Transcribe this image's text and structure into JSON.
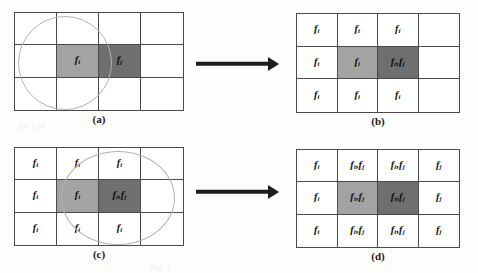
{
  "figure": {
    "colors": {
      "light_cell": "#a3a3a3",
      "dark_cell": "#6f6f6f",
      "plain_cell": "#ffffff",
      "grid_line": "#4a4a4a",
      "circle_stroke": "#b9b2ab",
      "arrow": "#1d1d1d",
      "background": "#fdfdfc"
    },
    "grid_shape": {
      "cols": 4,
      "rows": 3
    },
    "labels": {
      "fi": "f",
      "fi_sub": "i",
      "fj": "f",
      "fj_sub": "j"
    },
    "panels": [
      {
        "id": "a",
        "caption": "(a)",
        "neighborhood_circle": true,
        "circle_center_cell": {
          "row": 1,
          "col": 1
        },
        "cells": [
          [
            {
              "fill": "plain",
              "label": ""
            },
            {
              "fill": "plain",
              "label": ""
            },
            {
              "fill": "plain",
              "label": ""
            },
            {
              "fill": "plain",
              "label": ""
            }
          ],
          [
            {
              "fill": "plain",
              "label": ""
            },
            {
              "fill": "light",
              "label": "fi"
            },
            {
              "fill": "dark",
              "label": "fj"
            },
            {
              "fill": "plain",
              "label": ""
            }
          ],
          [
            {
              "fill": "plain",
              "label": ""
            },
            {
              "fill": "plain",
              "label": ""
            },
            {
              "fill": "plain",
              "label": ""
            },
            {
              "fill": "plain",
              "label": ""
            }
          ]
        ]
      },
      {
        "id": "b",
        "caption": "(b)",
        "neighborhood_circle": false,
        "circle_center_cell": null,
        "cells": [
          [
            {
              "fill": "plain",
              "label": "fi"
            },
            {
              "fill": "plain",
              "label": "fi"
            },
            {
              "fill": "plain",
              "label": "fi"
            },
            {
              "fill": "plain",
              "label": ""
            }
          ],
          [
            {
              "fill": "plain",
              "label": "fi"
            },
            {
              "fill": "light",
              "label": "fi"
            },
            {
              "fill": "dark",
              "label": "fi,fj"
            },
            {
              "fill": "plain",
              "label": ""
            }
          ],
          [
            {
              "fill": "plain",
              "label": "fi"
            },
            {
              "fill": "plain",
              "label": "fi"
            },
            {
              "fill": "plain",
              "label": "fi"
            },
            {
              "fill": "plain",
              "label": ""
            }
          ]
        ]
      },
      {
        "id": "c",
        "caption": "(c)",
        "neighborhood_circle": true,
        "circle_center_cell": {
          "row": 1,
          "col": 2
        },
        "cells": [
          [
            {
              "fill": "plain",
              "label": "fi"
            },
            {
              "fill": "plain",
              "label": "fi"
            },
            {
              "fill": "plain",
              "label": "fi"
            },
            {
              "fill": "plain",
              "label": ""
            }
          ],
          [
            {
              "fill": "plain",
              "label": "fi"
            },
            {
              "fill": "light",
              "label": "fi"
            },
            {
              "fill": "dark",
              "label": "fi,fj"
            },
            {
              "fill": "plain",
              "label": ""
            }
          ],
          [
            {
              "fill": "plain",
              "label": "fi"
            },
            {
              "fill": "plain",
              "label": "fi"
            },
            {
              "fill": "plain",
              "label": "fi"
            },
            {
              "fill": "plain",
              "label": ""
            }
          ]
        ]
      },
      {
        "id": "d",
        "caption": "(d)",
        "neighborhood_circle": false,
        "circle_center_cell": null,
        "cells": [
          [
            {
              "fill": "plain",
              "label": "fi"
            },
            {
              "fill": "plain",
              "label": "fi,fj"
            },
            {
              "fill": "plain",
              "label": "fi,fj"
            },
            {
              "fill": "plain",
              "label": "fj"
            }
          ],
          [
            {
              "fill": "plain",
              "label": "fi"
            },
            {
              "fill": "light",
              "label": "fi,fj"
            },
            {
              "fill": "dark",
              "label": "fi,fj"
            },
            {
              "fill": "plain",
              "label": "fj"
            }
          ],
          [
            {
              "fill": "plain",
              "label": "fi"
            },
            {
              "fill": "plain",
              "label": "fi,fj"
            },
            {
              "fill": "plain",
              "label": "fi,fj"
            },
            {
              "fill": "plain",
              "label": "fj"
            }
          ]
        ]
      }
    ],
    "arrows": [
      {
        "id": "arrow-top",
        "from_panel": "a",
        "to_panel": "b",
        "direction": "right"
      },
      {
        "id": "arrow-bottom",
        "from_panel": "c",
        "to_panel": "d",
        "direction": "right"
      }
    ]
  }
}
